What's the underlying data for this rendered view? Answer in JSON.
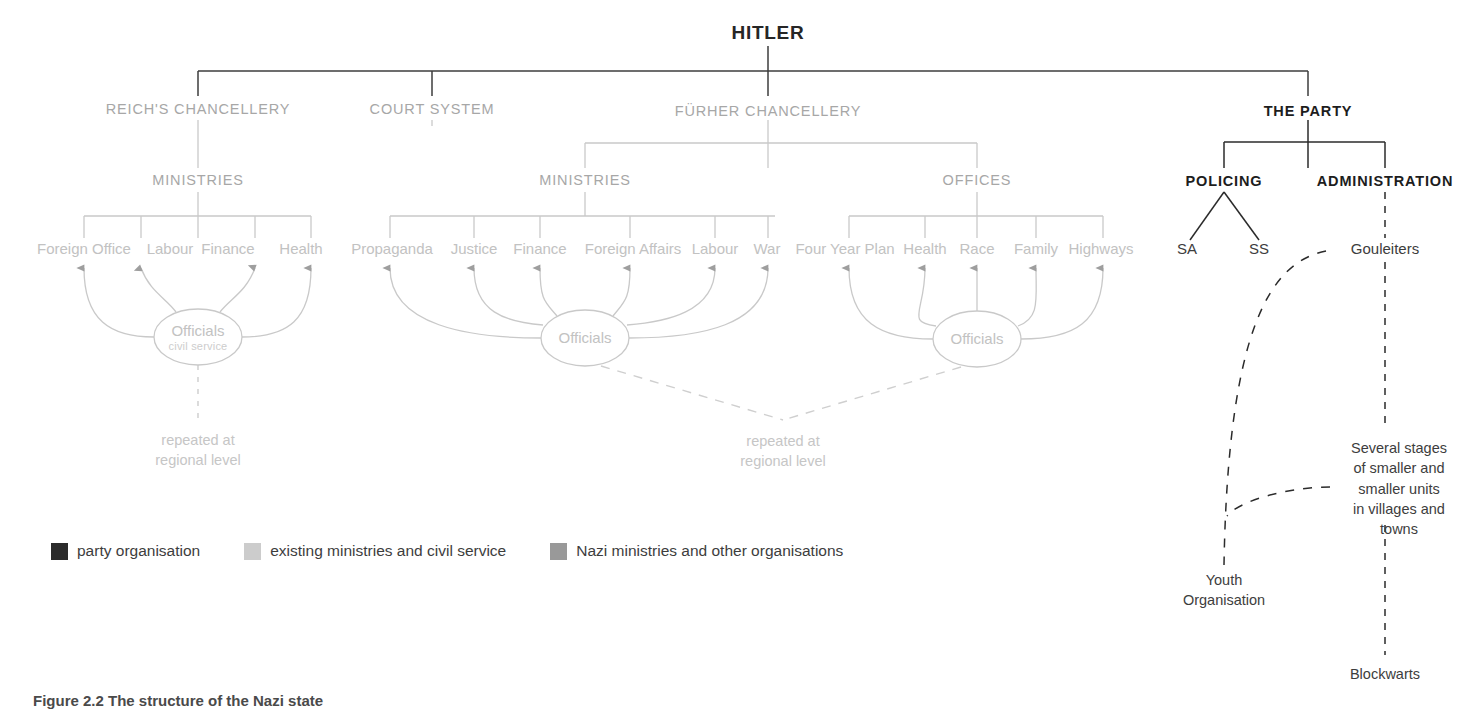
{
  "diagram": {
    "root": {
      "label": "HITLER"
    },
    "level1": [
      {
        "label": "REICH'S CHANCELLERY",
        "style": "grey"
      },
      {
        "label": "COURT SYSTEM",
        "style": "grey"
      },
      {
        "label": "FÜRHER CHANCELLERY",
        "style": "grey"
      },
      {
        "label": "THE PARTY",
        "style": "black"
      }
    ],
    "level2": [
      {
        "label": "MINISTRIES",
        "style": "grey"
      },
      {
        "label": "MINISTRIES",
        "style": "grey"
      },
      {
        "label": "OFFICES",
        "style": "grey"
      },
      {
        "label": "POLICING",
        "style": "black"
      },
      {
        "label": "ADMINISTRATION",
        "style": "black"
      }
    ],
    "group_reich_ministries": [
      "Foreign Office",
      "Labour",
      "Finance",
      "Health"
    ],
    "group_fuhrer_ministries": [
      "Propaganda",
      "Justice",
      "Finance",
      "Foreign Affairs",
      "Labour",
      "War"
    ],
    "group_fuhrer_offices": [
      "Four Year Plan",
      "Health",
      "Race",
      "Family",
      "Highways"
    ],
    "group_policing": [
      "SA",
      "SS"
    ],
    "officials": [
      {
        "label": "Officials",
        "sub": "civil service"
      },
      {
        "label": "Officials",
        "sub": ""
      },
      {
        "label": "Officials",
        "sub": ""
      }
    ],
    "notes": [
      {
        "line1": "repeated at",
        "line2": "regional level"
      },
      {
        "line1": "repeated at",
        "line2": "regional level"
      }
    ],
    "party_chain": {
      "gouleiters": "Gouleiters",
      "stages_l1": "Several stages",
      "stages_l2": "of smaller and",
      "stages_l3": "smaller units",
      "stages_l4": "in villages and",
      "stages_l5": "towns",
      "blockwarts": "Blockwarts",
      "youth_l1": "Youth",
      "youth_l2": "Organisation"
    }
  },
  "legend": {
    "items": [
      {
        "label": "party organisation",
        "color": "#2b2b2b"
      },
      {
        "label": "existing ministries and civil service",
        "color": "#cccccc"
      },
      {
        "label": "Nazi ministries and other organisations",
        "color": "#999999"
      }
    ]
  },
  "caption": {
    "text": "Figure 2.2 The structure of the Nazi state"
  },
  "colors": {
    "grey_line": "#c9c9c9",
    "black_line": "#2b2b2b",
    "arrow_grey": "#9e9e9e",
    "dash_grey": "#cfcfcf",
    "dash_dark": "#4a4a4a"
  }
}
